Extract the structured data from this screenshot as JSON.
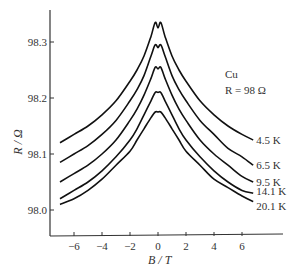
{
  "chart_data": {
    "type": "line",
    "title": "",
    "xlabel": "B / T",
    "ylabel": "R / Ω",
    "xlim": [
      -7.5,
      8.5
    ],
    "ylim": [
      97.95,
      98.36
    ],
    "xticks": [
      -6,
      -4,
      -2,
      0,
      2,
      4,
      6
    ],
    "xtick_labels": [
      "−6",
      "−4",
      "−2",
      "0",
      "2",
      "4",
      "6"
    ],
    "yticks": [
      98.0,
      98.1,
      98.2,
      98.3
    ],
    "ytick_labels": [
      "98.0",
      "98.1",
      "98.2",
      "98.3"
    ],
    "grid": false,
    "annotations": [
      "Cu",
      "R = 98 Ω"
    ],
    "legend_position": "inline labels at right end of curves",
    "x": [
      -7,
      -6,
      -5,
      -4,
      -3,
      -2,
      -1.5,
      -1,
      -0.5,
      -0.2,
      0,
      0.2,
      0.5,
      1,
      1.5,
      2,
      3,
      4,
      5,
      6,
      6.8
    ],
    "series": [
      {
        "name": "4.5 K",
        "values": [
          98.12,
          98.135,
          98.15,
          98.17,
          98.195,
          98.23,
          98.25,
          98.275,
          98.31,
          98.335,
          98.325,
          98.335,
          98.31,
          98.275,
          98.25,
          98.23,
          98.195,
          98.17,
          98.15,
          98.135,
          98.125
        ]
      },
      {
        "name": "6.5 K",
        "values": [
          98.085,
          98.1,
          98.115,
          98.135,
          98.16,
          98.195,
          98.215,
          98.24,
          98.275,
          98.295,
          98.29,
          98.295,
          98.275,
          98.24,
          98.215,
          98.195,
          98.16,
          98.135,
          98.11,
          98.095,
          98.08
        ]
      },
      {
        "name": "9.5 K",
        "values": [
          98.05,
          98.065,
          98.08,
          98.1,
          98.125,
          98.16,
          98.18,
          98.205,
          98.235,
          98.255,
          98.252,
          98.255,
          98.235,
          98.205,
          98.18,
          98.16,
          98.125,
          98.1,
          98.08,
          98.06,
          98.05
        ]
      },
      {
        "name": "14.1 K",
        "values": [
          98.02,
          98.035,
          98.05,
          98.07,
          98.095,
          98.125,
          98.145,
          98.17,
          98.195,
          98.21,
          98.21,
          98.21,
          98.195,
          98.17,
          98.145,
          98.125,
          98.095,
          98.07,
          98.05,
          98.035,
          98.03
        ]
      },
      {
        "name": "20.1 K",
        "values": [
          98.01,
          98.02,
          98.035,
          98.055,
          98.08,
          98.105,
          98.125,
          98.145,
          98.165,
          98.175,
          98.175,
          98.175,
          98.165,
          98.145,
          98.125,
          98.105,
          98.08,
          98.055,
          98.04,
          98.025,
          98.015
        ]
      }
    ],
    "series_label_y_values": [
      98.125,
      98.08,
      98.05,
      98.03,
      98.015
    ]
  },
  "labels": {
    "material": "Cu",
    "resistance": "R = 98 Ω",
    "xlabel": "B / T",
    "ylabel": "R / Ω"
  }
}
